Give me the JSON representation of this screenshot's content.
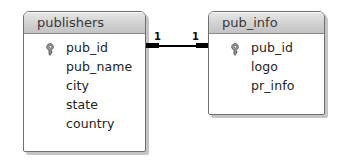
{
  "diagram": {
    "kind": "entity-relationship-diagram",
    "background_color": "#ffffff",
    "tables": [
      {
        "name": "publishers",
        "header_color": "#d4d4d4",
        "body_color": "#ffffff",
        "border_color": "#6f6f6f",
        "fields": [
          {
            "name": "pub_id",
            "key": true,
            "key_icon": "key-icon"
          },
          {
            "name": "pub_name",
            "key": false,
            "key_icon": ""
          },
          {
            "name": "city",
            "key": false,
            "key_icon": ""
          },
          {
            "name": "state",
            "key": false,
            "key_icon": ""
          },
          {
            "name": "country",
            "key": false,
            "key_icon": ""
          }
        ]
      },
      {
        "name": "pub_info",
        "header_color": "#d4d4d4",
        "body_color": "#ffffff",
        "border_color": "#6f6f6f",
        "fields": [
          {
            "name": "pub_id",
            "key": true,
            "key_icon": "key-icon"
          },
          {
            "name": "logo",
            "key": false,
            "key_icon": ""
          },
          {
            "name": "pr_info",
            "key": false,
            "key_icon": ""
          }
        ]
      }
    ],
    "relationship": {
      "type": "one-to-one",
      "left_cardinality": "1",
      "right_cardinality": "1",
      "line_color": "#000000",
      "from_table": "publishers",
      "from_field": "pub_id",
      "to_table": "pub_info",
      "to_field": "pub_id"
    }
  }
}
